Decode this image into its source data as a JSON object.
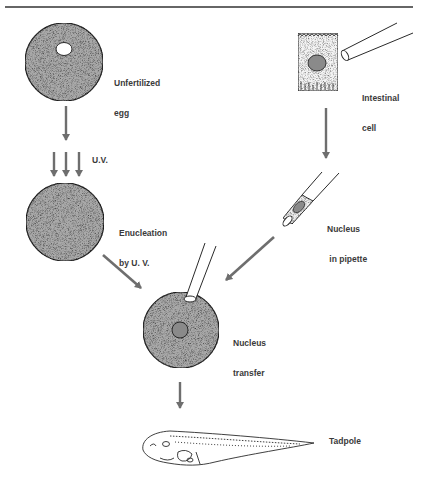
{
  "diagram": {
    "type": "process-flow",
    "title": "",
    "colors": {
      "arrow": "#6e6e6e",
      "cell_fill": "#a8a8a8",
      "nucleus_fill": "#8a8a8a",
      "outline": "#2a2a2a",
      "rule": "#333333"
    },
    "nodes": {
      "unfertilized_egg": {
        "label_line1": "Unfertilized",
        "label_line2": "egg"
      },
      "uv": {
        "label": "U.V."
      },
      "enucleation": {
        "label_line1": "Enucleation",
        "label_line2": "by U. V."
      },
      "intestinal_cell": {
        "label_line1": "Intestinal",
        "label_line2": "cell"
      },
      "nucleus_pipette": {
        "label_line1": "Nucleus",
        "label_line2": " in pipette"
      },
      "nucleus_transfer": {
        "label_line1": "Nucleus",
        "label_line2": "transfer"
      },
      "tadpole": {
        "label": "Tadpole"
      }
    },
    "edges": [
      {
        "from": "unfertilized_egg",
        "to": "enucleation",
        "via": "uv"
      },
      {
        "from": "intestinal_cell",
        "to": "nucleus_pipette"
      },
      {
        "from": "enucleation",
        "to": "nucleus_transfer"
      },
      {
        "from": "nucleus_pipette",
        "to": "nucleus_transfer"
      },
      {
        "from": "nucleus_transfer",
        "to": "tadpole"
      }
    ]
  }
}
